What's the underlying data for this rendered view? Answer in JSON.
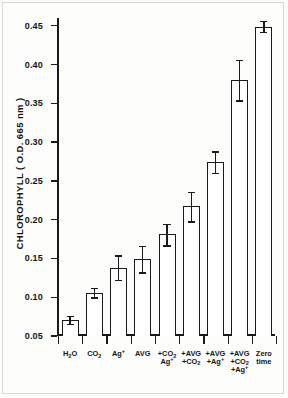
{
  "chart_data": {
    "type": "bar",
    "title": "",
    "xlabel": "",
    "ylabel": "CHLOROPHYLL ( O.D. 665 nm )",
    "ylim": [
      0.05,
      0.46
    ],
    "yticks": [
      "0.05",
      "0.10",
      "0.15",
      "0.20",
      "0.25",
      "0.30",
      "0.35",
      "0.40",
      "0.45"
    ],
    "ytick_values": [
      0.05,
      0.1,
      0.15,
      0.2,
      0.25,
      0.3,
      0.35,
      0.4,
      0.45
    ],
    "grid": false,
    "legend": "none",
    "categories": [
      "H2O",
      "CO2",
      "Ag+",
      "AVG",
      "+CO2 +Ag+",
      "+AVG +CO2",
      "+AVG +Ag+",
      "+AVG +CO2 +Ag+",
      "Zero time"
    ],
    "values": [
      0.071,
      0.106,
      0.138,
      0.149,
      0.181,
      0.217,
      0.274,
      0.38,
      0.449
    ],
    "errors": [
      0.005,
      0.006,
      0.016,
      0.017,
      0.014,
      0.019,
      0.014,
      0.026,
      0.007
    ],
    "bars": [
      {
        "value": 0.071,
        "error": 0.005,
        "label_lines": [
          [
            {
              "t": "H",
              "k": "n"
            },
            {
              "t": "2",
              "k": "sub"
            },
            {
              "t": "O",
              "k": "n"
            }
          ]
        ]
      },
      {
        "value": 0.106,
        "error": 0.006,
        "label_lines": [
          [
            {
              "t": "CO",
              "k": "n"
            },
            {
              "t": "2",
              "k": "sub"
            }
          ]
        ]
      },
      {
        "value": 0.138,
        "error": 0.016,
        "label_lines": [
          [
            {
              "t": "Ag",
              "k": "n"
            },
            {
              "t": "+",
              "k": "sup"
            }
          ]
        ]
      },
      {
        "value": 0.149,
        "error": 0.017,
        "label_lines": [
          [
            {
              "t": "AVG",
              "k": "n"
            }
          ]
        ]
      },
      {
        "value": 0.181,
        "error": 0.014,
        "label_lines": [
          [
            {
              "t": "+",
              "k": "plus"
            },
            {
              "t": "CO",
              "k": "n"
            },
            {
              "t": "2",
              "k": "sub"
            }
          ],
          [
            {
              "t": "Ag",
              "k": "n"
            },
            {
              "t": "+",
              "k": "sup"
            }
          ]
        ]
      },
      {
        "value": 0.217,
        "error": 0.019,
        "label_lines": [
          [
            {
              "t": "+",
              "k": "plus"
            },
            {
              "t": "AVG",
              "k": "n"
            }
          ],
          [
            {
              "t": "+",
              "k": "plus"
            },
            {
              "t": "CO",
              "k": "n"
            },
            {
              "t": "2",
              "k": "sub"
            }
          ]
        ]
      },
      {
        "value": 0.274,
        "error": 0.014,
        "label_lines": [
          [
            {
              "t": "+",
              "k": "plus"
            },
            {
              "t": "AVG",
              "k": "n"
            }
          ],
          [
            {
              "t": "+",
              "k": "plus"
            },
            {
              "t": "Ag",
              "k": "n"
            },
            {
              "t": "+",
              "k": "sup"
            }
          ]
        ]
      },
      {
        "value": 0.38,
        "error": 0.026,
        "label_lines": [
          [
            {
              "t": "+",
              "k": "plus"
            },
            {
              "t": "AVG",
              "k": "n"
            }
          ],
          [
            {
              "t": "+",
              "k": "plus"
            },
            {
              "t": "CO",
              "k": "n"
            },
            {
              "t": "2",
              "k": "sub"
            }
          ],
          [
            {
              "t": "+",
              "k": "plus"
            },
            {
              "t": "Ag",
              "k": "n"
            },
            {
              "t": "+",
              "k": "sup"
            }
          ]
        ]
      },
      {
        "value": 0.449,
        "error": 0.007,
        "label_lines": [
          [
            {
              "t": "Zero",
              "k": "n"
            }
          ],
          [
            {
              "t": "time",
              "k": "n"
            }
          ]
        ]
      }
    ],
    "colors": {
      "bar_fill": "#ffffff",
      "bar_stroke": "#1a1a1a",
      "axis": "#1a1a1a",
      "text": "#141414",
      "background": "#fdfdfb"
    }
  }
}
